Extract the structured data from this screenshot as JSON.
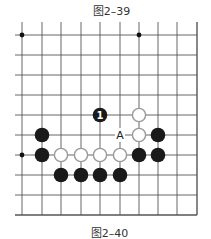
{
  "captions": {
    "top": "图2–39",
    "bottom": "图2–40"
  },
  "board": {
    "columns_x": [
      22,
      42,
      61,
      81,
      100,
      120,
      139,
      158,
      177,
      197
    ],
    "rows_y": [
      35,
      55,
      75,
      95,
      115,
      135,
      155,
      175,
      195,
      215
    ],
    "left_line_start": 15,
    "top_line_start": 22,
    "colors": {
      "line": "#555555",
      "black": "#1a1a1a",
      "white_fill": "#ffffff",
      "white_stroke": "#999999"
    },
    "star_points": [
      {
        "col": 0,
        "row": 0
      },
      {
        "col": 6,
        "row": 0
      },
      {
        "col": 0,
        "row": 6
      }
    ],
    "stones": [
      {
        "color": "black",
        "col": 4,
        "row": 4,
        "label": "1"
      },
      {
        "color": "white",
        "col": 6,
        "row": 4
      },
      {
        "color": "white",
        "col": 6,
        "row": 5
      },
      {
        "color": "black",
        "col": 7,
        "row": 5
      },
      {
        "color": "black",
        "col": 1,
        "row": 5
      },
      {
        "color": "black",
        "col": 1,
        "row": 6
      },
      {
        "color": "white",
        "col": 2,
        "row": 6
      },
      {
        "color": "white",
        "col": 3,
        "row": 6
      },
      {
        "color": "white",
        "col": 4,
        "row": 6
      },
      {
        "color": "white",
        "col": 5,
        "row": 6
      },
      {
        "color": "black",
        "col": 6,
        "row": 6
      },
      {
        "color": "black",
        "col": 7,
        "row": 6
      },
      {
        "color": "black",
        "col": 2,
        "row": 7
      },
      {
        "color": "black",
        "col": 3,
        "row": 7
      },
      {
        "color": "black",
        "col": 4,
        "row": 7
      },
      {
        "color": "black",
        "col": 5,
        "row": 7
      }
    ],
    "labels": [
      {
        "text": "A",
        "col": 5,
        "row": 5
      }
    ]
  }
}
